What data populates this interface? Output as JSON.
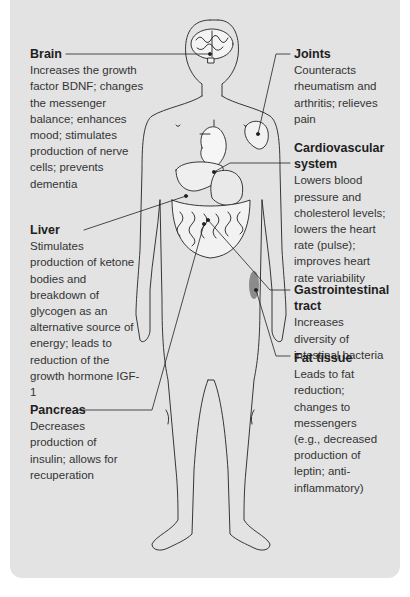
{
  "diagram": {
    "type": "anatomical-callout",
    "colors": {
      "panel_bg": "#e3e3e3",
      "page_bg": "#ffffff",
      "line": "#222222",
      "highlight": "#6e6e6e"
    },
    "callouts": [
      {
        "id": "brain",
        "title": "Brain",
        "description": "Increases the growth factor BDNF; changes the messenger balance; enhances mood; stimulates production of nerve cells; prevents dementia"
      },
      {
        "id": "liver",
        "title": "Liver",
        "description": "Stimulates production of ketone bodies and breakdown of glycogen as an alternative source of energy; leads to reduction of the growth hormone IGF-1"
      },
      {
        "id": "pancreas",
        "title": "Pancreas",
        "description": "Decreases production of insulin; allows for recuperation"
      },
      {
        "id": "joints",
        "title": "Joints",
        "description": "Counteracts rheumatism and arthritis; relieves pain"
      },
      {
        "id": "cardiovascular",
        "title": "Cardiovascular system",
        "description": "Lowers blood pressure and cholesterol levels; lowers the heart rate (pulse); improves heart rate variability"
      },
      {
        "id": "gastrointestinal",
        "title": "Gastrointestinal tract",
        "description": "Increases diversity of intestinal bacteria"
      },
      {
        "id": "fat",
        "title": "Fat tissue",
        "description": "Leads to fat reduction; changes to messengers (e.g., decreased production of leptin; anti-inflammatory)"
      }
    ]
  }
}
